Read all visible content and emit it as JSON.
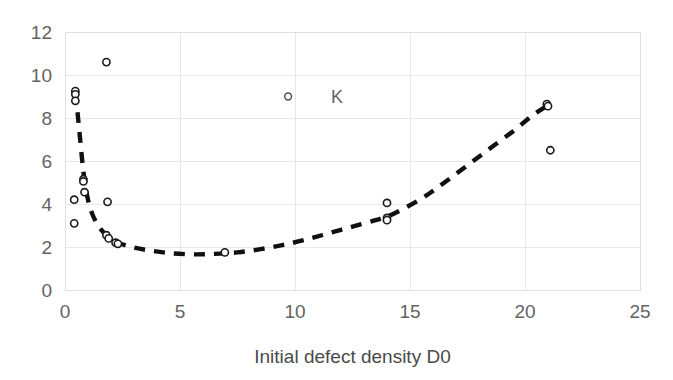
{
  "chart_data": {
    "type": "scatter",
    "title": "",
    "subtitle": "",
    "xlabel": "Initial defect density D0",
    "ylabel": "",
    "xlim": [
      0,
      25
    ],
    "ylim": [
      0,
      12
    ],
    "xticks": [
      0,
      5,
      10,
      15,
      20,
      25
    ],
    "yticks": [
      0,
      2,
      4,
      6,
      8,
      10,
      12
    ],
    "xtick_labels": [
      "0",
      "5",
      "10",
      "15",
      "20",
      "25"
    ],
    "ytick_labels": [
      "0",
      "2",
      "4",
      "6",
      "8",
      "10",
      "12"
    ],
    "grid": true,
    "grid_color": "#e8e8e8",
    "background": "#ffffff",
    "legend": {
      "entries": [
        {
          "name": "K",
          "marker": "open-circle",
          "color": "#4d4d4d"
        }
      ],
      "position": "inside-upper-center",
      "x": 9.7,
      "y": 9.0
    },
    "series": [
      {
        "name": "K",
        "type": "scatter",
        "marker": "open-circle",
        "color": "#1a1a1a",
        "points": [
          {
            "x": 0.45,
            "y": 9.25
          },
          {
            "x": 0.45,
            "y": 9.1
          },
          {
            "x": 0.45,
            "y": 8.8
          },
          {
            "x": 1.8,
            "y": 10.6
          },
          {
            "x": 0.8,
            "y": 5.15
          },
          {
            "x": 0.8,
            "y": 5.05
          },
          {
            "x": 0.85,
            "y": 4.55
          },
          {
            "x": 0.4,
            "y": 4.2
          },
          {
            "x": 1.85,
            "y": 4.1
          },
          {
            "x": 0.4,
            "y": 3.1
          },
          {
            "x": 1.8,
            "y": 2.55
          },
          {
            "x": 1.9,
            "y": 2.4
          },
          {
            "x": 2.2,
            "y": 2.2
          },
          {
            "x": 2.3,
            "y": 2.15
          },
          {
            "x": 6.95,
            "y": 1.75
          },
          {
            "x": 14.0,
            "y": 4.05
          },
          {
            "x": 14.0,
            "y": 3.35
          },
          {
            "x": 14.0,
            "y": 3.25
          },
          {
            "x": 20.95,
            "y": 8.65
          },
          {
            "x": 21.0,
            "y": 8.55
          },
          {
            "x": 21.1,
            "y": 6.5
          }
        ]
      },
      {
        "name": "trend",
        "type": "line",
        "style": "dashed",
        "color": "#101010",
        "points": [
          {
            "x": 0.45,
            "y": 9.2
          },
          {
            "x": 0.55,
            "y": 8.2
          },
          {
            "x": 0.65,
            "y": 7.1
          },
          {
            "x": 0.75,
            "y": 6.0
          },
          {
            "x": 0.85,
            "y": 5.1
          },
          {
            "x": 1.0,
            "y": 4.2
          },
          {
            "x": 1.2,
            "y": 3.5
          },
          {
            "x": 1.5,
            "y": 2.9
          },
          {
            "x": 1.9,
            "y": 2.45
          },
          {
            "x": 2.3,
            "y": 2.2
          },
          {
            "x": 2.9,
            "y": 2.0
          },
          {
            "x": 3.6,
            "y": 1.85
          },
          {
            "x": 4.5,
            "y": 1.72
          },
          {
            "x": 5.5,
            "y": 1.66
          },
          {
            "x": 6.5,
            "y": 1.68
          },
          {
            "x": 7.5,
            "y": 1.75
          },
          {
            "x": 8.5,
            "y": 1.9
          },
          {
            "x": 9.5,
            "y": 2.1
          },
          {
            "x": 10.5,
            "y": 2.35
          },
          {
            "x": 11.5,
            "y": 2.65
          },
          {
            "x": 12.5,
            "y": 2.95
          },
          {
            "x": 13.5,
            "y": 3.25
          },
          {
            "x": 14.2,
            "y": 3.5
          },
          {
            "x": 15.5,
            "y": 4.25
          },
          {
            "x": 16.5,
            "y": 5.0
          },
          {
            "x": 17.5,
            "y": 5.8
          },
          {
            "x": 18.5,
            "y": 6.6
          },
          {
            "x": 19.5,
            "y": 7.4
          },
          {
            "x": 20.3,
            "y": 8.1
          },
          {
            "x": 21.0,
            "y": 8.6
          }
        ]
      }
    ]
  },
  "plot": {
    "left": 65,
    "right": 640,
    "top": 32,
    "bottom": 290
  }
}
